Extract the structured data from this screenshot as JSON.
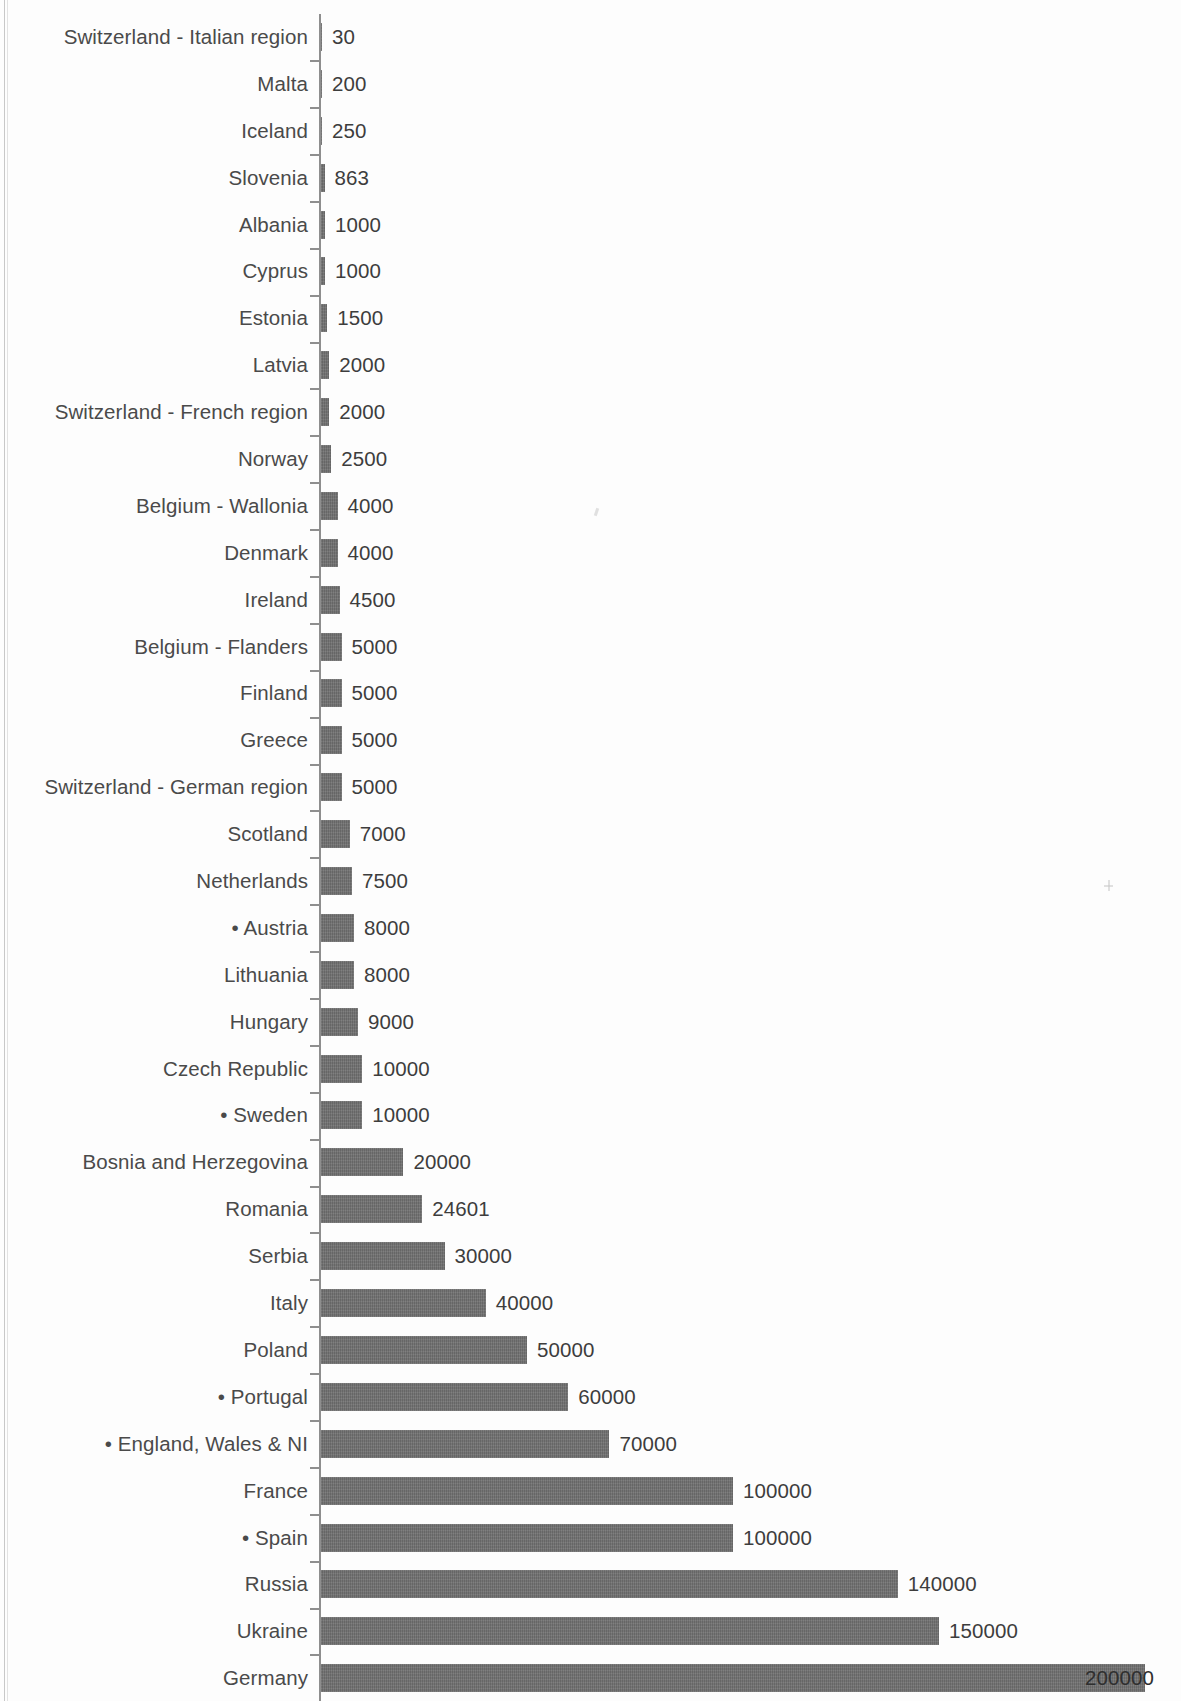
{
  "chart_data": {
    "type": "bar",
    "orientation": "horizontal",
    "title": "",
    "subtitle": "",
    "xlabel": "",
    "ylabel": "",
    "xlim": [
      0,
      200000
    ],
    "grid": false,
    "legend": null,
    "bar_color": "#6f6f6f",
    "label_color": "#4a4a4a",
    "axis_color": "#8e8e8e",
    "value_labels_shown": true,
    "categories": [
      "Switzerland - Italian region",
      "Malta",
      "Iceland",
      "Slovenia",
      "Albania",
      "Cyprus",
      "Estonia",
      "Latvia",
      "Switzerland - French region",
      "Norway",
      "Belgium - Wallonia",
      "Denmark",
      "Ireland",
      "Belgium - Flanders",
      "Finland",
      "Greece",
      "Switzerland - German region",
      "Scotland",
      "Netherlands",
      "• Austria",
      "Lithuania",
      "Hungary",
      "Czech Republic",
      "• Sweden",
      "Bosnia and Herzegovina",
      "Romania",
      "Serbia",
      "Italy",
      "Poland",
      "• Portugal",
      "• England, Wales & NI",
      "France",
      "• Spain",
      "Russia",
      "Ukraine",
      "Germany"
    ],
    "values": [
      30,
      200,
      250,
      863,
      1000,
      1000,
      1500,
      2000,
      2000,
      2500,
      4000,
      4000,
      4500,
      5000,
      5000,
      5000,
      5000,
      7000,
      7500,
      8000,
      8000,
      9000,
      10000,
      10000,
      20000,
      24601,
      30000,
      40000,
      50000,
      60000,
      70000,
      100000,
      100000,
      140000,
      150000,
      200000
    ],
    "value_labels": [
      "30",
      "200",
      "250",
      "863",
      "1000",
      "1000",
      "1500",
      "2000",
      "2000",
      "2500",
      "4000",
      "4000",
      "4500",
      "5000",
      "5000",
      "5000",
      "5000",
      "7000",
      "7500",
      "8000",
      "8000",
      "9000",
      "10000",
      "10000",
      "20000",
      "24601",
      "30000",
      "40000",
      "50000",
      "60000",
      "70000",
      "100000",
      "100000",
      "140000",
      "150000",
      "200000"
    ]
  }
}
